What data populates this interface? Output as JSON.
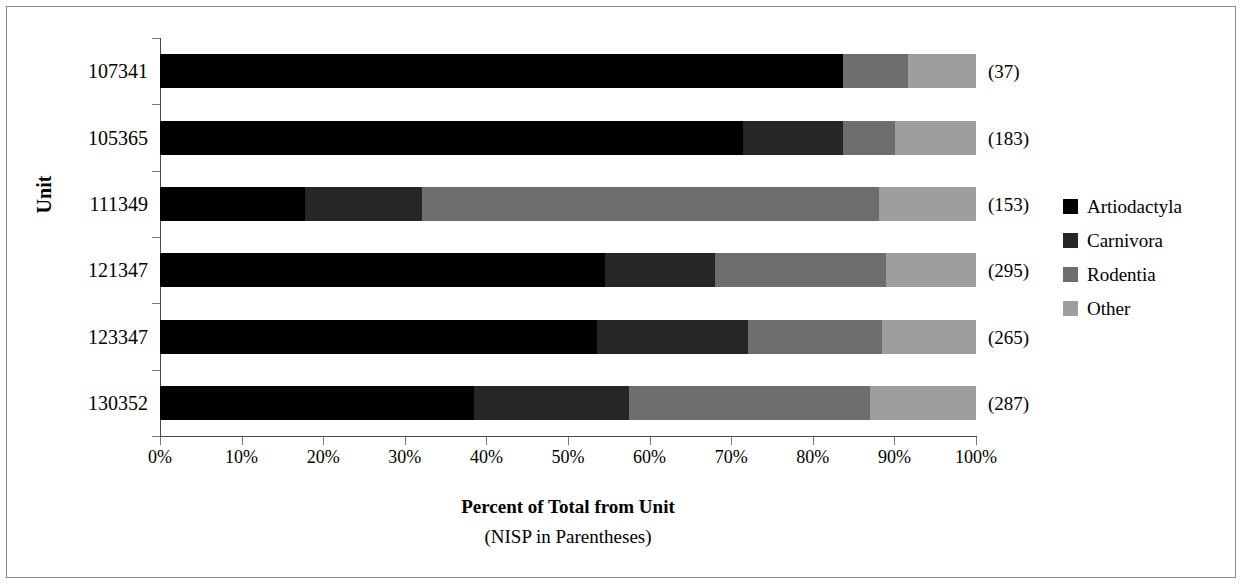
{
  "chart_data": {
    "type": "bar",
    "subtype": "stacked-horizontal-100percent",
    "title": "",
    "xlabel": "Percent of Total from Unit",
    "xlabel_sub": "(NISP in Parentheses)",
    "ylabel": "Unit",
    "xlim": [
      0,
      100
    ],
    "grid": false,
    "legend_position": "right",
    "categories": [
      "107341",
      "105365",
      "111349",
      "121347",
      "123347",
      "130352"
    ],
    "annotations": [
      "(37)",
      "(183)",
      "(153)",
      "(295)",
      "(265)",
      "(287)"
    ],
    "nisp": [
      37,
      183,
      153,
      295,
      265,
      287
    ],
    "tick_labels": [
      "0%",
      "10%",
      "20%",
      "30%",
      "40%",
      "50%",
      "60%",
      "70%",
      "80%",
      "90%",
      "100%"
    ],
    "tick_values": [
      0,
      10,
      20,
      30,
      40,
      50,
      60,
      70,
      80,
      90,
      100
    ],
    "series": [
      {
        "name": "Artiodactyla",
        "color": "#000000",
        "values": [
          83.7,
          71.4,
          17.8,
          54.5,
          53.5,
          38.5
        ]
      },
      {
        "name": "Carnivora",
        "color": "#262626",
        "values": [
          0.0,
          12.3,
          14.3,
          13.5,
          18.5,
          19.0
        ]
      },
      {
        "name": "Rodentia",
        "color": "#6e6e6e",
        "values": [
          8.0,
          6.4,
          56.0,
          21.0,
          16.5,
          29.5
        ]
      },
      {
        "name": "Other",
        "color": "#9e9e9e",
        "values": [
          8.3,
          9.9,
          11.9,
          11.0,
          11.5,
          13.0
        ]
      }
    ]
  },
  "legend": {
    "items": [
      {
        "label": "Artiodactyla"
      },
      {
        "label": "Carnivora"
      },
      {
        "label": "Rodentia"
      },
      {
        "label": "Other"
      }
    ]
  }
}
